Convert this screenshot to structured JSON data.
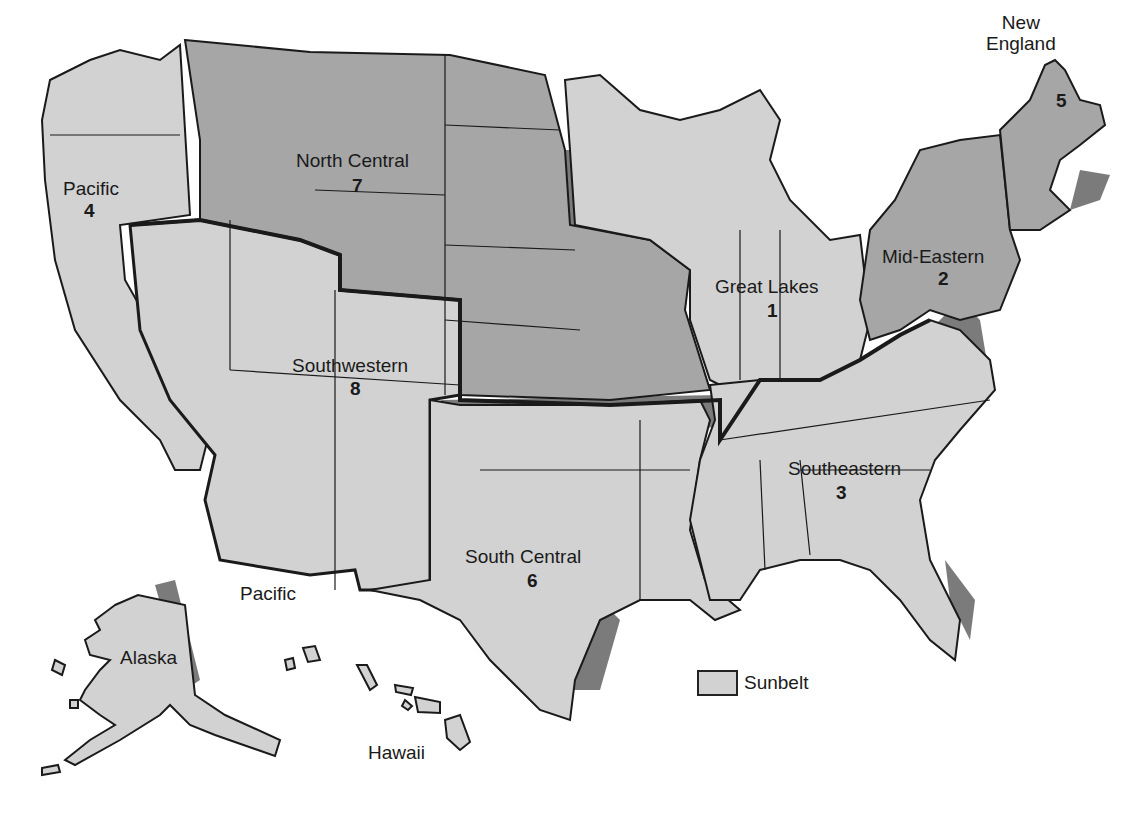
{
  "colors": {
    "sunbelt": "#d2d2d2",
    "non_sunbelt": "#a6a6a6",
    "shadow": "#7b7b7b",
    "border": "#1a1a1a",
    "background": "#ffffff"
  },
  "regions": [
    {
      "name": "Great Lakes",
      "number": "1",
      "sunbelt": false
    },
    {
      "name": "Mid-Eastern",
      "number": "2",
      "sunbelt": false
    },
    {
      "name": "Southeastern",
      "number": "3",
      "sunbelt": true
    },
    {
      "name": "Pacific",
      "number": "4",
      "sunbelt": true
    },
    {
      "name": "New England",
      "number": "5",
      "sunbelt": false
    },
    {
      "name": "South Central",
      "number": "6",
      "sunbelt": true
    },
    {
      "name": "North Central",
      "number": "7",
      "sunbelt": false
    },
    {
      "name": "Southwestern",
      "number": "8",
      "sunbelt": true
    }
  ],
  "labels": {
    "new_england_line1": "New",
    "new_england_line2": "England",
    "new_england_num": "5",
    "north_central": "North Central",
    "north_central_num": "7",
    "pacific": "Pacific",
    "pacific_num": "4",
    "mid_eastern": "Mid-Eastern",
    "mid_eastern_num": "2",
    "great_lakes": "Great Lakes",
    "great_lakes_num": "1",
    "southwestern": "Southwestern",
    "southwestern_num": "8",
    "southeastern": "Southeastern",
    "southeastern_num": "3",
    "south_central": "South Central",
    "south_central_num": "6",
    "pacific_ocean": "Pacific",
    "alaska": "Alaska",
    "hawaii": "Hawaii"
  },
  "legend": {
    "label": "Sunbelt"
  }
}
